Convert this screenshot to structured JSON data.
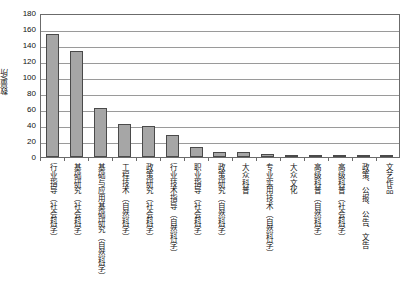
{
  "chart_data": {
    "type": "bar",
    "title": "",
    "xlabel": "",
    "ylabel": "数量/所",
    "ylim": [
      0,
      180
    ],
    "ytick_step": 20,
    "grid": true,
    "legend": "none",
    "bar_color": "#a6a6a6",
    "bar_edge_color": "#4a4a4a",
    "yticks": [
      "180",
      "160",
      "140",
      "120",
      "100",
      "80",
      "60",
      "40",
      "20",
      "0"
    ],
    "categories": [
      "行业指导（社会科学）",
      "基础研究（社会科学）",
      "基础与应用基础研究（自然科学）",
      "工程技术（自然科学）",
      "政策研究（社会科学）",
      "行业技术指导（自然科学）",
      "职业指导（社会科学）",
      "政策研究（自然科学）",
      "大众科普",
      "专业实用技术（自然科学）",
      "大众文化",
      "高级科普（自然科学）",
      "高级科普（社会科学）",
      "政策、公报、公告、文告",
      "文艺作品"
    ],
    "values": [
      154,
      133,
      61,
      41,
      39,
      28,
      13,
      6,
      6,
      4,
      3,
      2,
      2,
      1,
      1
    ]
  }
}
